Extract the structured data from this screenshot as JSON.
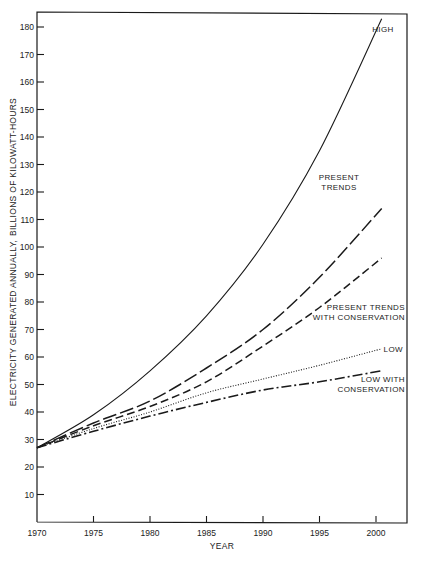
{
  "chart_data": {
    "type": "line",
    "title": "",
    "xlabel": "YEAR",
    "ylabel_line1": "ELECTRICITY GENERATED ANNUALLY,",
    "ylabel_line2": "BILLIONS OF KILOWATT-HOURS",
    "xlim": [
      1970,
      2003
    ],
    "ylim": [
      0,
      185
    ],
    "grid": false,
    "legend_position": "inline labels at curve ends",
    "x_ticks": [
      1970,
      1975,
      1980,
      1985,
      1990,
      1995,
      2000
    ],
    "y_ticks": [
      10,
      20,
      30,
      40,
      50,
      60,
      70,
      80,
      90,
      100,
      110,
      120,
      130,
      140,
      150,
      160,
      170,
      180
    ],
    "x": [
      1970,
      1975,
      1980,
      1985,
      1990,
      1995,
      2000.5
    ],
    "series": [
      {
        "name": "HIGH",
        "style": "solid",
        "values": [
          27,
          39,
          55,
          75,
          101,
          135,
          183
        ]
      },
      {
        "name": "PRESENT TRENDS",
        "style": "long-dash",
        "values": [
          27,
          36,
          44,
          56,
          70,
          89,
          114
        ]
      },
      {
        "name": "PRESENT TRENDS WITH CONSERVATION",
        "style": "dash",
        "values": [
          27,
          35,
          42,
          51,
          64,
          78,
          96
        ]
      },
      {
        "name": "LOW",
        "style": "dotted",
        "values": [
          27,
          34,
          40,
          47,
          52,
          57,
          63
        ]
      },
      {
        "name": "LOW WITH CONSERVATION",
        "style": "dash-dot",
        "values": [
          27,
          33,
          38.5,
          43.5,
          48,
          51,
          55
        ]
      }
    ],
    "annotations": [
      {
        "text": [
          "HIGH"
        ],
        "series": "HIGH"
      },
      {
        "text": [
          "PRESENT",
          "TRENDS"
        ],
        "series": "PRESENT TRENDS"
      },
      {
        "text": [
          "PRESENT TRENDS",
          "WITH CONSERVATION"
        ],
        "series": "PRESENT TRENDS WITH CONSERVATION"
      },
      {
        "text": [
          "LOW"
        ],
        "series": "LOW"
      },
      {
        "text": [
          "LOW WITH",
          "CONSERVATION"
        ],
        "series": "LOW WITH CONSERVATION"
      }
    ]
  },
  "colors": {
    "ink": "#1a1a1a",
    "background": "#ffffff"
  }
}
